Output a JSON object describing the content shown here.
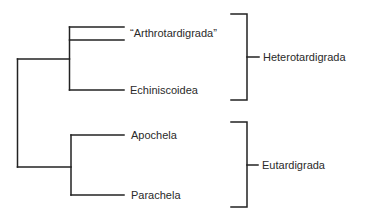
{
  "diagram": {
    "type": "phylogenetic-cladogram",
    "line_color": "#222222",
    "text_color": "#2a2a2a",
    "taxa": [
      {
        "id": "arthrotardigrada",
        "label": "“Arthrotardigrada”",
        "x": 130,
        "y": 33
      },
      {
        "id": "echiniscoidea",
        "label": "Echiniscoidea",
        "x": 130,
        "y": 90
      },
      {
        "id": "apochela",
        "label": "Apochela",
        "x": 131,
        "y": 135
      },
      {
        "id": "parachela",
        "label": "Parachela",
        "x": 131,
        "y": 195
      }
    ],
    "groups": [
      {
        "id": "heterotardigrada",
        "label": "Heterotardigrada",
        "members": [
          "arthrotardigrada",
          "echiniscoidea"
        ],
        "x": 263,
        "y": 57
      },
      {
        "id": "eutardigrada",
        "label": "Eutardigrada",
        "members": [
          "apochela",
          "parachela"
        ],
        "x": 262,
        "y": 165
      }
    ]
  }
}
